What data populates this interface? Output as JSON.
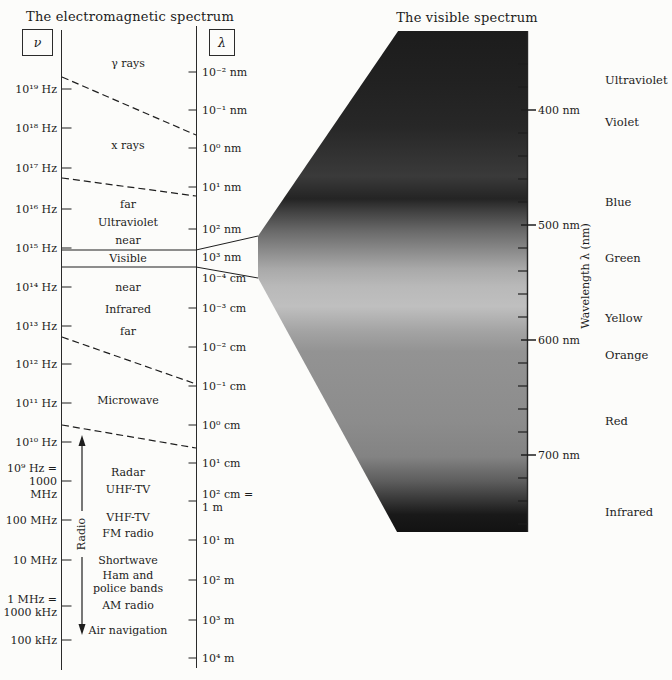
{
  "titles": {
    "left": "The electromagnetic spectrum",
    "right": "The visible spectrum"
  },
  "axis_symbols": {
    "frequency": "ν",
    "wavelength": "λ"
  },
  "freq_ticks": [
    {
      "label": "10¹⁹ Hz",
      "y": 89
    },
    {
      "label": "10¹⁸ Hz",
      "y": 128
    },
    {
      "label": "10¹⁷ Hz",
      "y": 168
    },
    {
      "label": "10¹⁶ Hz",
      "y": 209
    },
    {
      "label": "10¹⁵ Hz",
      "y": 248
    },
    {
      "label": "10¹⁴ Hz",
      "y": 287
    },
    {
      "label": "10¹³ Hz",
      "y": 326
    },
    {
      "label": "10¹² Hz",
      "y": 364
    },
    {
      "label": "10¹¹ Hz",
      "y": 403
    },
    {
      "label": "10¹⁰ Hz",
      "y": 442
    },
    {
      "label": "10⁹ Hz =\n1000 MHz",
      "y": 481
    },
    {
      "label": "100 MHz",
      "y": 520
    },
    {
      "label": "10 MHz",
      "y": 560
    },
    {
      "label": "1 MHz =\n1000 kHz",
      "y": 606
    },
    {
      "label": "100 kHz",
      "y": 640
    }
  ],
  "wave_ticks": [
    {
      "label": "10⁻² nm",
      "y": 72
    },
    {
      "label": "10⁻¹ nm",
      "y": 110
    },
    {
      "label": "10⁰ nm",
      "y": 148
    },
    {
      "label": "10¹ nm",
      "y": 187
    },
    {
      "label": "10² nm",
      "y": 229
    },
    {
      "label": "10³ nm",
      "y": 257,
      "no_tick": true
    },
    {
      "label": "10⁻⁴ cm",
      "y": 278,
      "no_tick": true
    },
    {
      "label": "10⁻³ cm",
      "y": 308
    },
    {
      "label": "10⁻² cm",
      "y": 347
    },
    {
      "label": "10⁻¹ cm",
      "y": 386
    },
    {
      "label": "10⁰ cm",
      "y": 425
    },
    {
      "label": "10¹ cm",
      "y": 463
    },
    {
      "label": "10² cm =\n1 m",
      "y": 501
    },
    {
      "label": "10¹ m",
      "y": 540
    },
    {
      "label": "10² m",
      "y": 580
    },
    {
      "label": "10³ m",
      "y": 620
    },
    {
      "label": "10⁴ m",
      "y": 658
    }
  ],
  "em_regions": [
    {
      "label": "γ rays",
      "y": 63
    },
    {
      "label": "x rays",
      "y": 145
    },
    {
      "label": "far",
      "y": 204
    },
    {
      "label": "Ultraviolet",
      "y": 222
    },
    {
      "label": "near",
      "y": 240
    },
    {
      "label": "Visible",
      "y": 258
    },
    {
      "label": "near",
      "y": 287
    },
    {
      "label": "Infrared",
      "y": 309
    },
    {
      "label": "far",
      "y": 331
    },
    {
      "label": "Microwave",
      "y": 400
    },
    {
      "label": "Radar",
      "y": 472
    },
    {
      "label": "UHF-TV",
      "y": 489
    },
    {
      "label": "VHF-TV",
      "y": 517
    },
    {
      "label": "FM radio",
      "y": 533
    },
    {
      "label": "Shortwave",
      "y": 560
    },
    {
      "label": "Ham and\npolice bands",
      "y": 582
    },
    {
      "label": "AM radio",
      "y": 605
    },
    {
      "label": "Air navigation",
      "y": 630
    }
  ],
  "radio": {
    "label": "Radio"
  },
  "visible": {
    "axis_label": "Wavelength λ (nm)",
    "major_ticks": [
      {
        "label": "400 nm",
        "y": 110
      },
      {
        "label": "500 nm",
        "y": 225
      },
      {
        "label": "600 nm",
        "y": 340
      },
      {
        "label": "700 nm",
        "y": 455
      }
    ],
    "minor_tick_ys": [
      64,
      87,
      133,
      156,
      179,
      202,
      248,
      271,
      294,
      317,
      363,
      386,
      409,
      432,
      478,
      501,
      524
    ],
    "color_labels": [
      {
        "label": "Ultraviolet",
        "y": 80
      },
      {
        "label": "Violet",
        "y": 122
      },
      {
        "label": "Blue",
        "y": 202
      },
      {
        "label": "Green",
        "y": 258
      },
      {
        "label": "Yellow",
        "y": 318
      },
      {
        "label": "Orange",
        "y": 355
      },
      {
        "label": "Red",
        "y": 421
      },
      {
        "label": "Infrared",
        "y": 512
      }
    ],
    "gradient": [
      {
        "p": "0%",
        "c": "#1c1c1c"
      },
      {
        "p": "10%",
        "c": "#212121"
      },
      {
        "p": "19%",
        "c": "#272727"
      },
      {
        "p": "29%",
        "c": "#3a3a3a"
      },
      {
        "p": "33.5%",
        "c": "#242424"
      },
      {
        "p": "36%",
        "c": "#414141"
      },
      {
        "p": "40%",
        "c": "#6a6a6a"
      },
      {
        "p": "44%",
        "c": "#8c8c8c"
      },
      {
        "p": "47.5%",
        "c": "#a9a9a9"
      },
      {
        "p": "51%",
        "c": "#b9b9b9"
      },
      {
        "p": "55%",
        "c": "#bfbfbf"
      },
      {
        "p": "60%",
        "c": "#a3a3a3"
      },
      {
        "p": "64%",
        "c": "#939393"
      },
      {
        "p": "78%",
        "c": "#8c8c8c"
      },
      {
        "p": "85%",
        "c": "#838383"
      },
      {
        "p": "90%",
        "c": "#5c5c5c"
      },
      {
        "p": "94%",
        "c": "#333333"
      },
      {
        "p": "96.5%",
        "c": "#191919"
      },
      {
        "p": "100%",
        "c": "#121212"
      }
    ]
  },
  "colors": {
    "ink": "#1e1e1e",
    "paper": "#fcfcfa"
  }
}
